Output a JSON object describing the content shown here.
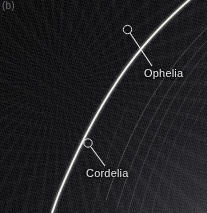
{
  "figure": {
    "panel_label": "(b)",
    "image_type": "spacecraft-grayscale-photograph",
    "background_color": "#050507",
    "ring_color": "#f2f2ee",
    "faint_ring_color": "#8e8e90",
    "annotation_color": "#e8e8e8",
    "marker_color": "#dcdcdc"
  },
  "annotations": [
    {
      "name": "ophelia",
      "label": "Ophelia",
      "label_x": 144,
      "label_y": 68,
      "marker_x": 127.5,
      "marker_y": 29.5,
      "marker_radius": 4.2,
      "leader_from_x": 130,
      "leader_from_y": 33,
      "leader_to_x": 152,
      "leader_to_y": 66
    },
    {
      "name": "cordelia",
      "label": "Cordelia",
      "label_x": 86,
      "label_y": 168,
      "marker_x": 88,
      "marker_y": 143,
      "marker_radius": 4.2,
      "leader_from_x": 91,
      "leader_from_y": 147,
      "leader_to_x": 105,
      "leader_to_y": 166
    }
  ],
  "rings": {
    "bright_ring": {
      "name": "epsilon-ring",
      "brightness": "bright",
      "stroke_width": 1.8,
      "path": "M 196 -6 C 170 16 142 44 118 80 C 96 113 76 152 58 196 L 52 213"
    },
    "faint_rings": [
      {
        "name": "faint-ring-1",
        "stroke_width": 0.7,
        "opacity": 0.55,
        "path": "M 213 22 C 190 44 168 70 150 100 C 133 129 118 164 106 200"
      },
      {
        "name": "faint-ring-2",
        "stroke_width": 0.6,
        "opacity": 0.48,
        "path": "M 213 34 C 192 56 172 82 156 112 C 140 141 127 175 117 208"
      },
      {
        "name": "faint-ring-3",
        "stroke_width": 0.6,
        "opacity": 0.42,
        "path": "M 213 45 C 194 66 176 92 162 121 C 148 150 136 182 128 213"
      },
      {
        "name": "faint-ring-4",
        "stroke_width": 0.5,
        "opacity": 0.34,
        "path": "M 213 58 C 197 79 181 104 168 132 C 156 160 146 188 140 213"
      },
      {
        "name": "faint-ring-5",
        "stroke_width": 0.5,
        "opacity": 0.28,
        "path": "M 213 72 C 199 92 186 116 174 143 C 164 168 156 193 152 213"
      },
      {
        "name": "faint-ring-6",
        "stroke_width": 0.5,
        "opacity": 0.22,
        "path": "M 213 88 C 202 107 191 129 181 154 C 173 176 167 196 164 213"
      },
      {
        "name": "faint-ring-inner-streak",
        "stroke_width": 0.5,
        "opacity": 0.3,
        "path": "M 126 108 C 116 131 106 158 99 186 C 96 197 94 206 93 213"
      }
    ]
  }
}
